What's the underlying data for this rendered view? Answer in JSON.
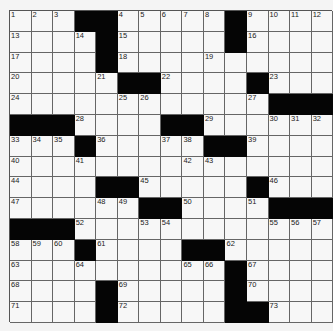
{
  "puzzle": {
    "type": "crossword",
    "rows": 15,
    "cols": 15,
    "colors": {
      "black": "#050505",
      "white": "#f7f7f7",
      "line": "#666666"
    },
    "grid": [
      [
        "1",
        "2",
        "3",
        "#",
        "#",
        "4",
        "5",
        "6",
        "7",
        "8",
        "#",
        "9",
        "10",
        "11",
        "12"
      ],
      [
        "13",
        "",
        "",
        "14",
        "#",
        "15",
        "",
        "",
        "",
        "",
        "#",
        "16",
        "",
        "",
        ""
      ],
      [
        "17",
        "",
        "",
        "",
        "#",
        "18",
        "",
        "",
        "",
        "19",
        "",
        "",
        "",
        "",
        ""
      ],
      [
        "20",
        "",
        "",
        "",
        "21",
        "#",
        "#",
        "22",
        "",
        "",
        "",
        "#",
        "23",
        "",
        ""
      ],
      [
        "24",
        "",
        "",
        "",
        "",
        "25",
        "26",
        "",
        "",
        "",
        "",
        "27",
        "#",
        "#",
        "#"
      ],
      [
        "#",
        "#",
        "#",
        "28",
        "",
        "",
        "",
        "#",
        "#",
        "29",
        "",
        "",
        "30",
        "31",
        "32"
      ],
      [
        "33",
        "34",
        "35",
        "#",
        "36",
        "",
        "",
        "37",
        "38",
        "#",
        "#",
        "39",
        "",
        "",
        ""
      ],
      [
        "40",
        "",
        "",
        "41",
        "",
        "",
        "",
        "",
        "42",
        "43",
        "",
        "",
        "",
        "",
        ""
      ],
      [
        "44",
        "",
        "",
        "",
        "#",
        "#",
        "45",
        "",
        "",
        "",
        "",
        "#",
        "46",
        "",
        ""
      ],
      [
        "47",
        "",
        "",
        "",
        "48",
        "49",
        "#",
        "#",
        "50",
        "",
        "",
        "51",
        "#",
        "#",
        "#"
      ],
      [
        "#",
        "#",
        "#",
        "52",
        "",
        "",
        "53",
        "54",
        "",
        "",
        "",
        "",
        "55",
        "56",
        "57"
      ],
      [
        "58",
        "59",
        "60",
        "#",
        "61",
        "",
        "",
        "",
        "#",
        "#",
        "62",
        "",
        "",
        "",
        ""
      ],
      [
        "63",
        "",
        "",
        "64",
        "",
        "",
        "",
        "",
        "65",
        "66",
        "#",
        "67",
        "",
        "",
        ""
      ],
      [
        "68",
        "",
        "",
        "",
        "#",
        "69",
        "",
        "",
        "",
        "",
        "#",
        "70",
        "",
        "",
        ""
      ],
      [
        "71",
        "",
        "",
        "",
        "#",
        "72",
        "",
        "",
        "",
        "",
        "#",
        "#",
        "73",
        "",
        ""
      ]
    ]
  }
}
